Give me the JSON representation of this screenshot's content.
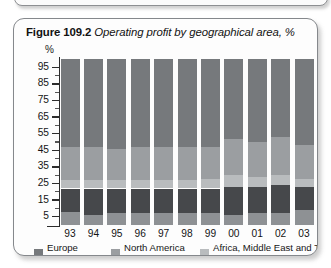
{
  "figure": {
    "label": "Figure 109.2",
    "caption": "Operating profit by geographical area, %"
  },
  "chart_data": {
    "type": "bar",
    "subtype": "stacked-bar-100",
    "title": "Operating profit by geographical area, %",
    "xlabel": "",
    "ylabel": "%",
    "ylim": [
      0,
      100
    ],
    "yticks": [
      5,
      15,
      25,
      35,
      45,
      55,
      65,
      75,
      85,
      95
    ],
    "ytick_labels": [
      "5",
      "15",
      "25",
      "35",
      "45",
      "55",
      "65",
      "75",
      "85",
      "95"
    ],
    "grid": false,
    "legend_position": "bottom",
    "categories": [
      "93",
      "94",
      "95",
      "96",
      "97",
      "98",
      "99",
      "00",
      "01",
      "02",
      "03"
    ],
    "series": [
      {
        "name": "Europe",
        "color": "#76797c",
        "values": [
          53,
          53,
          54,
          53,
          53,
          53,
          53,
          48,
          50,
          47,
          52
        ]
      },
      {
        "name": "North America",
        "color": "#9b9ea1",
        "values": [
          20,
          20,
          19,
          20,
          20,
          20,
          19,
          22,
          21,
          23,
          20
        ]
      },
      {
        "name": "Africa, Middle East and Turkey",
        "color": "#b9bcbe",
        "values": [
          5,
          5,
          5,
          5,
          5,
          5,
          6,
          7,
          6,
          6,
          5
        ]
      },
      {
        "name": "Asia and Pacific",
        "color": "#46484b",
        "values": [
          14,
          16,
          15,
          15,
          15,
          15,
          15,
          17,
          16,
          17,
          14
        ]
      },
      {
        "name": "Latin America",
        "color": "#8e9194",
        "values": [
          8,
          6,
          7,
          7,
          7,
          7,
          7,
          6,
          7,
          7,
          9
        ]
      }
    ]
  },
  "legend": [
    {
      "label": "Europe",
      "swatch": "sw-europe"
    },
    {
      "label": "North America",
      "swatch": "sw-northamer"
    },
    {
      "label": "Africa, Middle East and Turkey",
      "swatch": "sw-africa"
    },
    {
      "label": "Asia and Pacific",
      "swatch": "sw-asia"
    },
    {
      "label": "Latin America",
      "swatch": "sw-latin"
    }
  ]
}
